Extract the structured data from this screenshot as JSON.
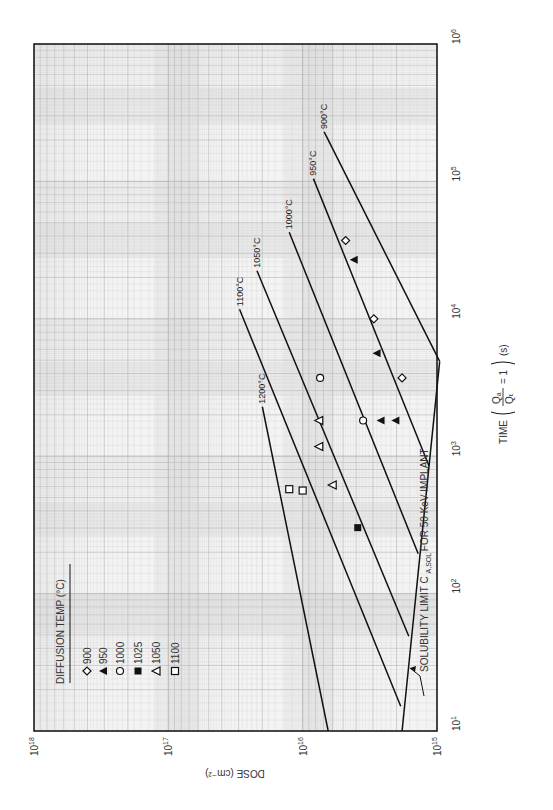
{
  "chart_data": {
    "type": "line",
    "orientation": "rotated-90-ccw",
    "title": "",
    "xlabel": "TIME (Q_A / Q_T = 1) (s)",
    "ylabel": "DOSE (cm^-2)",
    "x_scale": "log",
    "y_scale": "log",
    "xlim": [
      10,
      1000000
    ],
    "ylim": [
      1000000000000000.0,
      1e+18
    ],
    "x_ticks": [
      "10^1",
      "10^2",
      "10^3",
      "10^4",
      "10^5",
      "10^6"
    ],
    "y_ticks": [
      "10^15",
      "10^16",
      "10^17",
      "10^18"
    ],
    "grid": true,
    "series": [
      {
        "name": "1200°C",
        "label": "1200°C",
        "points_log": [
          [
            3.36,
            16.3
          ],
          [
            1.0,
            15.81
          ]
        ]
      },
      {
        "name": "1100°C",
        "label": "1100°C",
        "points_log": [
          [
            4.07,
            16.47
          ],
          [
            1.18,
            15.27
          ]
        ]
      },
      {
        "name": "1050°C",
        "label": "1050°C",
        "points_log": [
          [
            4.35,
            16.34
          ],
          [
            1.69,
            15.21
          ]
        ]
      },
      {
        "name": "1000°C",
        "label": "1000°C",
        "points_log": [
          [
            4.63,
            16.1
          ],
          [
            2.29,
            15.14
          ]
        ]
      },
      {
        "name": "950°C",
        "label": "950°C",
        "points_log": [
          [
            5.02,
            15.92
          ],
          [
            2.93,
            15.06
          ]
        ]
      },
      {
        "name": "900°C",
        "label": "900°C",
        "points_log": [
          [
            5.36,
            15.84
          ],
          [
            3.69,
            14.98
          ]
        ]
      }
    ],
    "solubility_limit": {
      "label": "SOLUBILITY LIMIT C",
      "subscript": "A,SOL",
      "suffix": "FOR 50 KeV IMPLANT",
      "points_log": [
        [
          3.69,
          14.98
        ],
        [
          1.0,
          15.26
        ]
      ]
    },
    "data_points": [
      {
        "temp": "900",
        "marker": "diamond",
        "log_t": 4.57,
        "log_dose": 15.68
      },
      {
        "temp": "900",
        "marker": "diamond",
        "log_t": 4.0,
        "log_dose": 15.47
      },
      {
        "temp": "900",
        "marker": "diamond",
        "log_t": 3.57,
        "log_dose": 15.26
      },
      {
        "temp": "950",
        "marker": "triangle-filled",
        "log_t": 4.43,
        "log_dose": 15.62
      },
      {
        "temp": "950",
        "marker": "triangle-filled",
        "log_t": 3.75,
        "log_dose": 15.45
      },
      {
        "temp": "950",
        "marker": "triangle-filled",
        "log_t": 3.26,
        "log_dose": 15.42
      },
      {
        "temp": "950",
        "marker": "triangle-filled",
        "log_t": 3.26,
        "log_dose": 15.31
      },
      {
        "temp": "1000",
        "marker": "circle",
        "log_t": 3.57,
        "log_dose": 15.87
      },
      {
        "temp": "1000",
        "marker": "circle",
        "log_t": 3.26,
        "log_dose": 15.55
      },
      {
        "temp": "1025",
        "marker": "square-filled",
        "log_t": 2.48,
        "log_dose": 15.59
      },
      {
        "temp": "1050",
        "marker": "triangle-open",
        "log_t": 3.26,
        "log_dose": 15.88
      },
      {
        "temp": "1050",
        "marker": "triangle-open",
        "log_t": 3.07,
        "log_dose": 15.88
      },
      {
        "temp": "1050",
        "marker": "triangle-open",
        "log_t": 2.79,
        "log_dose": 15.78
      },
      {
        "temp": "1100",
        "marker": "square-open",
        "log_t": 2.76,
        "log_dose": 16.1
      },
      {
        "temp": "1100",
        "marker": "square-open",
        "log_t": 2.75,
        "log_dose": 16.0
      }
    ],
    "legend": {
      "title": "DIFFUSION TEMP (°C)",
      "position": "upper-left (rotated)",
      "entries": [
        {
          "marker": "diamond",
          "label": "900"
        },
        {
          "marker": "triangle-filled",
          "label": "950"
        },
        {
          "marker": "circle",
          "label": "1000"
        },
        {
          "marker": "square-filled",
          "label": "1025"
        },
        {
          "marker": "triangle-open",
          "label": "1050"
        },
        {
          "marker": "square-open",
          "label": "1100"
        }
      ]
    }
  },
  "colors": {
    "background": "#ffffff",
    "paper": "#f3f3f3",
    "grid_minor": "#d4d4d4",
    "grid_major": "#b4b4b4",
    "band": "#e2e2e2",
    "ink": "#111111"
  }
}
